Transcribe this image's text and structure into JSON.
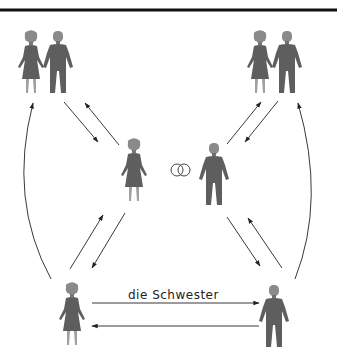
{
  "diagram": {
    "type": "family-relationship",
    "colors": {
      "figure": "#5e5e5e",
      "figure_head": "#8a8a8a",
      "figure_legs": "#9a9a9a",
      "arrow": "#222222",
      "rule": "#111111",
      "rings": "#444444"
    },
    "nodes": [
      {
        "id": "parents-left",
        "label": "",
        "figures": [
          "woman",
          "man"
        ]
      },
      {
        "id": "parents-right",
        "label": "",
        "figures": [
          "woman",
          "man"
        ]
      },
      {
        "id": "spouse-woman",
        "label": "",
        "figures": [
          "woman"
        ]
      },
      {
        "id": "spouse-man",
        "label": "",
        "figures": [
          "man"
        ]
      },
      {
        "id": "sibling-woman",
        "label": "",
        "figures": [
          "woman"
        ]
      },
      {
        "id": "sibling-man",
        "label": "",
        "figures": [
          "man"
        ]
      }
    ],
    "marriage_symbol": "wedding-rings-icon",
    "edges": [
      {
        "from": "sibling-woman",
        "to": "sibling-man",
        "label": "die Schwester"
      },
      {
        "from": "sibling-man",
        "to": "sibling-woman",
        "label": ""
      },
      {
        "from": "parents-left",
        "to": "spouse-woman",
        "label": ""
      },
      {
        "from": "spouse-woman",
        "to": "parents-left",
        "label": ""
      },
      {
        "from": "parents-right",
        "to": "spouse-man",
        "label": ""
      },
      {
        "from": "spouse-man",
        "to": "parents-right",
        "label": ""
      },
      {
        "from": "spouse-woman",
        "to": "sibling-woman",
        "label": ""
      },
      {
        "from": "sibling-woman",
        "to": "spouse-woman",
        "label": ""
      },
      {
        "from": "spouse-man",
        "to": "sibling-man",
        "label": ""
      },
      {
        "from": "sibling-man",
        "to": "spouse-man",
        "label": ""
      },
      {
        "from": "sibling-woman",
        "to": "parents-left",
        "label": ""
      },
      {
        "from": "sibling-man",
        "to": "parents-right",
        "label": ""
      }
    ]
  }
}
